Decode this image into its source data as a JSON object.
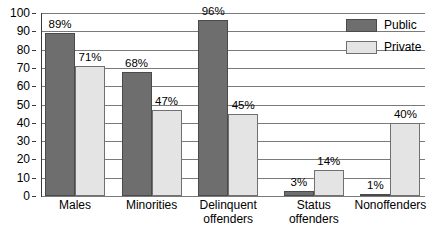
{
  "chart_data": {
    "type": "bar",
    "title": "",
    "subtitle": "",
    "xlabel": "",
    "ylabel": "",
    "ylim": [
      0,
      100
    ],
    "ytick_step": 10,
    "yticks": [
      "0",
      "10",
      "20",
      "30",
      "40",
      "50",
      "60",
      "70",
      "80",
      "90",
      "100"
    ],
    "grid": true,
    "legend_position": "top-right",
    "categories": [
      "Males",
      "Minorities",
      "Delinquent offenders",
      "Status offenders",
      "Nonoffenders"
    ],
    "category_lines": [
      [
        "Males"
      ],
      [
        "Minorities"
      ],
      [
        "Delinquent",
        "offenders"
      ],
      [
        "Status",
        "offenders"
      ],
      [
        "Nonoffenders"
      ]
    ],
    "series": [
      {
        "name": "Public",
        "color": "#6e6e6e",
        "values": [
          89,
          68,
          96,
          3,
          1
        ],
        "labels": [
          "89%",
          "68%",
          "96%",
          "3%",
          "1%"
        ]
      },
      {
        "name": "Private",
        "color": "#e4e4e4",
        "values": [
          71,
          47,
          45,
          14,
          40
        ],
        "labels": [
          "71%",
          "47%",
          "45%",
          "14%",
          "40%"
        ]
      }
    ]
  },
  "legend": {
    "items": [
      {
        "label": "Public",
        "swatch": "public"
      },
      {
        "label": "Private",
        "swatch": "private"
      }
    ]
  },
  "colors": {
    "public": "#6e6e6e",
    "private": "#e4e4e4",
    "gridline": "#7a7a7a",
    "axis": "#3a3a3a",
    "background": "#ffffff",
    "text": "#000000"
  }
}
